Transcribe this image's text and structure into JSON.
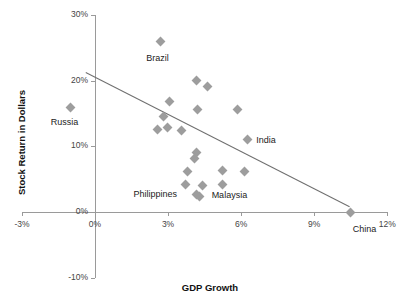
{
  "chart_data": {
    "type": "scatter",
    "title": "",
    "xlabel": "GDP Growth",
    "ylabel": "Stock Return in Dollars",
    "xlim": [
      -3,
      12
    ],
    "ylim": [
      -10,
      30
    ],
    "xticks": [
      "-3%",
      "0%",
      "3%",
      "6%",
      "9%",
      "12%"
    ],
    "xtick_values": [
      -3,
      0,
      3,
      6,
      9,
      12
    ],
    "yticks": [
      "30%",
      "20%",
      "10%",
      "0%",
      "-10%"
    ],
    "ytick_values": [
      30,
      20,
      10,
      0,
      -10
    ],
    "grid": false,
    "legend": "none",
    "marker_color": "#9d9d9d",
    "trendline_color": "#6f6f6f",
    "axis_color": "#9a9a9a",
    "trendline": {
      "x_start": -0.35,
      "y_start": 21.3,
      "x_end": 10.5,
      "y_end": 0.8
    },
    "points": [
      {
        "label": "Russia",
        "x": -1.0,
        "y": 16.0,
        "label_dx": -20,
        "label_dy": 10
      },
      {
        "label": "Brazil",
        "x": 2.68,
        "y": 26.0,
        "label_dx": -14,
        "label_dy": 12
      },
      {
        "label": "",
        "x": 4.15,
        "y": 20.0,
        "label_dx": 0,
        "label_dy": 0
      },
      {
        "label": "",
        "x": 4.62,
        "y": 19.2,
        "label_dx": 0,
        "label_dy": 0
      },
      {
        "label": "",
        "x": 3.05,
        "y": 16.8,
        "label_dx": 0,
        "label_dy": 0
      },
      {
        "label": "",
        "x": 4.22,
        "y": 15.6,
        "label_dx": 0,
        "label_dy": 0
      },
      {
        "label": "",
        "x": 5.85,
        "y": 15.6,
        "label_dx": 0,
        "label_dy": 0
      },
      {
        "label": "",
        "x": 2.82,
        "y": 14.5,
        "label_dx": 0,
        "label_dy": 0
      },
      {
        "label": "",
        "x": 2.55,
        "y": 12.6,
        "label_dx": 0,
        "label_dy": 0
      },
      {
        "label": "",
        "x": 2.98,
        "y": 12.9,
        "label_dx": 0,
        "label_dy": 0
      },
      {
        "label": "",
        "x": 3.55,
        "y": 12.4,
        "label_dx": 0,
        "label_dy": 0
      },
      {
        "label": "India",
        "x": 6.25,
        "y": 11.1,
        "label_dx": 9,
        "label_dy": -4
      },
      {
        "label": "",
        "x": 4.15,
        "y": 9.0,
        "label_dx": 0,
        "label_dy": 0
      },
      {
        "label": "",
        "x": 4.08,
        "y": 8.2,
        "label_dx": 0,
        "label_dy": 0
      },
      {
        "label": "",
        "x": 3.78,
        "y": 6.2,
        "label_dx": 0,
        "label_dy": 0
      },
      {
        "label": "",
        "x": 5.25,
        "y": 6.3,
        "label_dx": 0,
        "label_dy": 0
      },
      {
        "label": "",
        "x": 6.12,
        "y": 6.2,
        "label_dx": 0,
        "label_dy": 0
      },
      {
        "label": "Philippines",
        "x": 3.72,
        "y": 4.2,
        "label_dx": -52,
        "label_dy": 5
      },
      {
        "label": "",
        "x": 5.25,
        "y": 4.2,
        "label_dx": 0,
        "label_dy": 0
      },
      {
        "label": "Malaysia",
        "x": 4.42,
        "y": 4.1,
        "label_dx": 9,
        "label_dy": 5
      },
      {
        "label": "",
        "x": 4.18,
        "y": 2.7,
        "label_dx": 0,
        "label_dy": 0
      },
      {
        "label": "",
        "x": 4.3,
        "y": 2.3,
        "label_dx": 0,
        "label_dy": 0
      },
      {
        "label": "China",
        "x": 10.5,
        "y": 0.0,
        "label_dx": 2,
        "label_dy": 12
      }
    ]
  }
}
